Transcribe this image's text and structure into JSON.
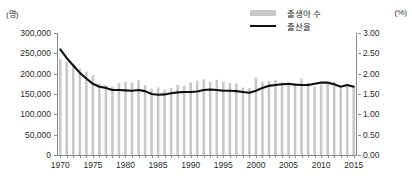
{
  "axis": {
    "left_unit": "(명)",
    "right_unit": "(%)",
    "left_ticks": [
      "300,000",
      "250,000",
      "200,000",
      "150,000",
      "100,000",
      "50,000",
      "0"
    ],
    "right_ticks": [
      "3.00",
      "2.50",
      "2.00",
      "1.50",
      "1.00",
      "0.50",
      "0.00"
    ],
    "x_ticks": [
      "1970",
      "1975",
      "1980",
      "1985",
      "1990",
      "1995",
      "2000",
      "2005",
      "2010",
      "2015"
    ]
  },
  "legend": {
    "bar_label": "출생아 수",
    "line_label": "출산율",
    "bar_color": "#c8c8c8",
    "line_color": "#111111"
  },
  "chart_data": {
    "type": "bar",
    "title": "",
    "subtitle": "",
    "xlabel": "",
    "ylabel": "(명)",
    "y2label": "(%)",
    "ylim": [
      0,
      300000
    ],
    "y2lim": [
      0,
      3.0
    ],
    "grid": false,
    "legend_position": "top-right",
    "categories": [
      1970,
      1971,
      1972,
      1973,
      1974,
      1975,
      1976,
      1977,
      1978,
      1979,
      1980,
      1981,
      1982,
      1983,
      1984,
      1985,
      1986,
      1987,
      1988,
      1989,
      1990,
      1991,
      1992,
      1993,
      1994,
      1995,
      1996,
      1997,
      1998,
      1999,
      2000,
      2001,
      2002,
      2003,
      2004,
      2005,
      2006,
      2007,
      2008,
      2009,
      2010,
      2011,
      2012,
      2013,
      2014,
      2015
    ],
    "series": [
      {
        "name": "출생아 수",
        "type": "bar",
        "axis": "left",
        "unit": "명",
        "values": [
          236000,
          228000,
          222000,
          212000,
          205000,
          196000,
          176000,
          172000,
          168000,
          177000,
          180000,
          178000,
          184000,
          172000,
          163000,
          166000,
          161000,
          165000,
          172000,
          170000,
          178000,
          183000,
          186000,
          180000,
          185000,
          180000,
          177000,
          176000,
          166000,
          165000,
          190000,
          180000,
          182000,
          184000,
          179000,
          172000,
          176000,
          188000,
          178000,
          168000,
          173000,
          176000,
          180000,
          164000,
          168000,
          170000
        ]
      },
      {
        "name": "출산율",
        "type": "line",
        "axis": "right",
        "unit": "%",
        "values": [
          2.6,
          2.38,
          2.2,
          2.02,
          1.88,
          1.75,
          1.68,
          1.65,
          1.6,
          1.6,
          1.59,
          1.58,
          1.6,
          1.57,
          1.5,
          1.48,
          1.49,
          1.52,
          1.54,
          1.55,
          1.55,
          1.56,
          1.6,
          1.61,
          1.6,
          1.58,
          1.58,
          1.57,
          1.55,
          1.53,
          1.58,
          1.65,
          1.7,
          1.72,
          1.74,
          1.75,
          1.73,
          1.72,
          1.72,
          1.75,
          1.78,
          1.78,
          1.74,
          1.68,
          1.72,
          1.68
        ]
      }
    ]
  },
  "caption": ""
}
